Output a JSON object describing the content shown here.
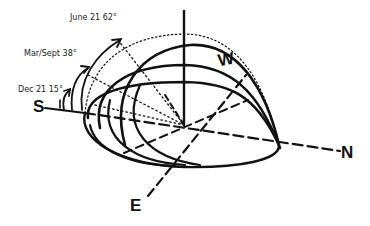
{
  "diagram": {
    "type": "sun-path hemisphere",
    "labels": {
      "june": "June 21 62°",
      "equinox": "Mar/Sept 38°",
      "december": "Dec 21 15°"
    },
    "directions": {
      "south": "S",
      "west": "W",
      "north": "N",
      "east": "E"
    },
    "sun_paths": [
      {
        "date": "June 21",
        "altitude_deg": 62
      },
      {
        "date": "Mar/Sept",
        "altitude_deg": 38
      },
      {
        "date": "Dec 21",
        "altitude_deg": 15
      }
    ],
    "colors": {
      "ink": "#111111",
      "background": "#ffffff"
    }
  }
}
